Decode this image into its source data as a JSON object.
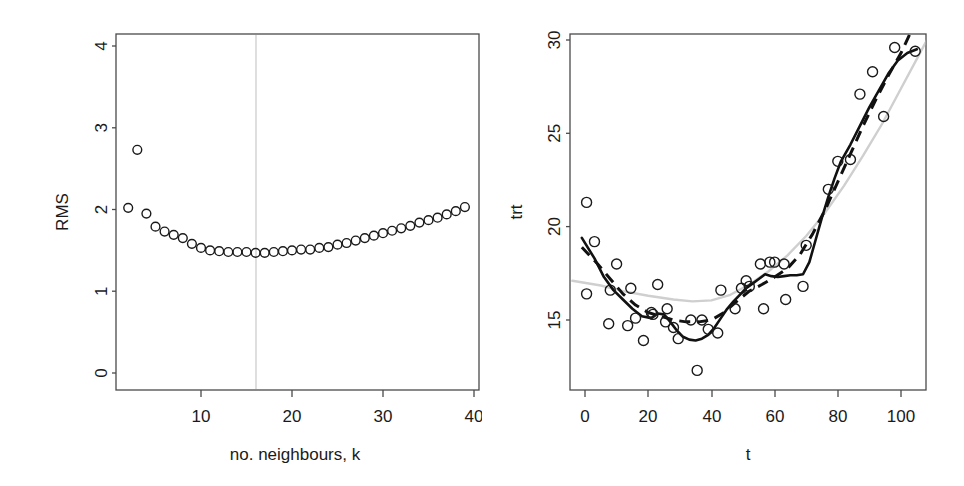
{
  "figure": {
    "type": "multi-panel-scatter",
    "panel_count": 2,
    "background": "#ffffff",
    "foreground": "#1a1a1a"
  },
  "chart_data": [
    {
      "id": "left",
      "type": "scatter",
      "title": "",
      "xlabel": "no. neighbours, k",
      "ylabel": "RMS",
      "xlim": [
        1.6,
        40.6
      ],
      "ylim": [
        -0.12,
        4.18
      ],
      "xticks": [
        10,
        20,
        30,
        40
      ],
      "xtick_labels": [
        "10",
        "20",
        "30",
        "40"
      ],
      "yticks": [
        0,
        1,
        2,
        3,
        4
      ],
      "ytick_labels": [
        "0",
        "1",
        "2",
        "3",
        "4"
      ],
      "grid": false,
      "legend": null,
      "marker": "open-circle",
      "annotations": [
        {
          "kind": "vertical-line",
          "x": 16,
          "color": "#c9c9c9",
          "label": "selected k = 16"
        }
      ],
      "x": [
        2,
        3,
        4,
        5,
        6,
        7,
        8,
        9,
        10,
        11,
        12,
        13,
        14,
        15,
        16,
        17,
        18,
        19,
        20,
        21,
        22,
        23,
        24,
        25,
        26,
        27,
        28,
        29,
        30,
        31,
        32,
        33,
        34,
        35,
        36,
        37,
        38,
        39
      ],
      "values": [
        2.02,
        2.73,
        1.95,
        1.79,
        1.73,
        1.69,
        1.65,
        1.58,
        1.53,
        1.5,
        1.49,
        1.48,
        1.48,
        1.48,
        1.47,
        1.47,
        1.48,
        1.49,
        1.5,
        1.51,
        1.51,
        1.53,
        1.54,
        1.57,
        1.59,
        1.62,
        1.65,
        1.68,
        1.71,
        1.74,
        1.77,
        1.8,
        1.84,
        1.87,
        1.9,
        1.94,
        1.98,
        2.03
      ]
    },
    {
      "id": "right",
      "type": "scatter",
      "title": "",
      "xlabel": "t",
      "ylabel": "trt",
      "xlim": [
        -4,
        112
      ],
      "ylim": [
        11.6,
        30.6
      ],
      "xticks": [
        0,
        20,
        40,
        60,
        80,
        100
      ],
      "xtick_labels": [
        "0",
        "20",
        "40",
        "60",
        "80",
        "100"
      ],
      "yticks": [
        15,
        20,
        25,
        30
      ],
      "ytick_labels": [
        "15",
        "20",
        "25",
        "30"
      ],
      "grid": false,
      "legend": null,
      "marker": "open-circle",
      "points": [
        [
          0.5,
          21.3
        ],
        [
          0.5,
          16.4
        ],
        [
          3.0,
          19.2
        ],
        [
          7.5,
          14.8
        ],
        [
          8.0,
          16.6
        ],
        [
          10.0,
          18.0
        ],
        [
          13.5,
          14.7
        ],
        [
          14.5,
          16.7
        ],
        [
          16.0,
          15.1
        ],
        [
          18.5,
          13.9
        ],
        [
          21.0,
          15.4
        ],
        [
          21.5,
          15.3
        ],
        [
          23.0,
          16.9
        ],
        [
          25.5,
          14.9
        ],
        [
          26.0,
          15.6
        ],
        [
          28.0,
          14.6
        ],
        [
          29.5,
          14.0
        ],
        [
          33.5,
          15.0
        ],
        [
          35.5,
          12.3
        ],
        [
          37.0,
          15.0
        ],
        [
          39.0,
          14.5
        ],
        [
          42.0,
          14.3
        ],
        [
          43.0,
          16.6
        ],
        [
          47.5,
          15.6
        ],
        [
          49.5,
          16.7
        ],
        [
          51.0,
          17.1
        ],
        [
          52.0,
          16.8
        ],
        [
          55.5,
          18.0
        ],
        [
          56.5,
          15.6
        ],
        [
          58.5,
          18.1
        ],
        [
          60.0,
          18.1
        ],
        [
          63.0,
          18.0
        ],
        [
          63.5,
          16.1
        ],
        [
          69.0,
          16.8
        ],
        [
          70.0,
          19.0
        ],
        [
          77.0,
          22.0
        ],
        [
          80.0,
          23.5
        ],
        [
          84.0,
          23.6
        ],
        [
          87.0,
          27.1
        ],
        [
          91.0,
          28.3
        ],
        [
          94.5,
          25.9
        ],
        [
          98.0,
          29.6
        ],
        [
          104.5,
          29.4
        ]
      ],
      "series": [
        {
          "name": "solid-fit",
          "style": "solid",
          "color": "#111111"
        },
        {
          "name": "dashed-fit",
          "style": "dashed",
          "color": "#111111"
        },
        {
          "name": "grey-fit",
          "style": "solid",
          "color": "#cfcfcf"
        }
      ]
    }
  ]
}
